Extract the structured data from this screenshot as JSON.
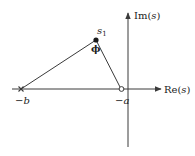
{
  "diagram": {
    "type": "s-plane pole-zero geometry",
    "colors": {
      "stroke": "#3a3a3a",
      "text": "#222222",
      "background": "#ffffff"
    },
    "axes": {
      "imaginary_label": {
        "prefix": "Im(",
        "var": "s",
        "suffix": ")"
      },
      "real_label": {
        "prefix": "Re(",
        "var": "s",
        "suffix": ")"
      }
    },
    "points": [
      {
        "id": "s1",
        "label_main": "s",
        "label_sub": "1",
        "marker": "filled-dot"
      },
      {
        "id": "neg_b",
        "label_sign": "−",
        "label_var": "b",
        "marker": "cross"
      },
      {
        "id": "neg_a",
        "label_sign": "−",
        "label_var": "a",
        "marker": "open-circle"
      }
    ],
    "angle": {
      "label": "ϕ",
      "at": "s1"
    }
  }
}
